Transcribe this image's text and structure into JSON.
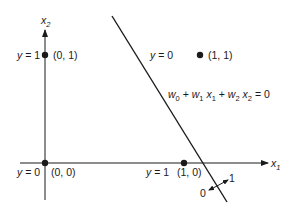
{
  "diagram": {
    "type": "perceptron-decision-boundary",
    "axes": {
      "x_label": "x",
      "x_sub": "1",
      "y_label": "x",
      "y_sub": "2"
    },
    "points": [
      {
        "id": "p00",
        "y_label": "y = 0",
        "coord": "(0, 0)"
      },
      {
        "id": "p01",
        "y_label": "y = 1",
        "coord": "(0, 1)"
      },
      {
        "id": "p10",
        "y_label": "y = 1",
        "coord": "(1, 0)"
      },
      {
        "id": "p11",
        "y_label": "y = 0",
        "coord": "(1, 1)"
      }
    ],
    "equation": {
      "w0": "w",
      "w0_sub": "0",
      "plus1": " + ",
      "w1": "w",
      "w1_sub": "1",
      "x1": " x",
      "x1_sub": "1",
      "plus2": " + ",
      "w2": "w",
      "w2_sub": "2",
      "x2": " x",
      "x2_sub": "2",
      "eq": " = 0"
    },
    "side_labels": {
      "negative": "0",
      "positive": "1"
    },
    "colors": {
      "ink": "#1a1a1a",
      "background": "#ffffff"
    }
  }
}
